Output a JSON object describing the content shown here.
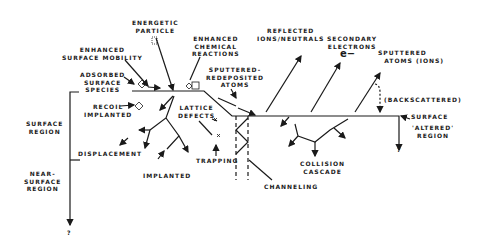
{
  "diagram": {
    "type": "ion-surface interaction schematic",
    "labels": {
      "energetic_particle": "ENERGETIC\nPARTICLE",
      "enhanced_surface_mobility": "ENHANCED\nSURFACE MOBILITY",
      "enhanced_chemical_reactions": "ENHANCED\nCHEMICAL\nREACTIONS",
      "adsorbed_surface_species": "ADSORBED\nSURFACE\nSPECIES",
      "sputtered_redeposited_atoms": "SPUTTERED-\nREDEPOSITED\nATOMS",
      "reflected_ions_neutrals": "REFLECTED\nIONS/NEUTRALS",
      "secondary_electrons": "SECONDARY\nELECTRONS",
      "electron_symbol": "e−",
      "sputtered_atoms_ions": "SPUTTERED\n  ATOMS (IONS)",
      "backscattered": "(BACKSCATTERED)",
      "surface": "SURFACE",
      "altered_region": "'ALTERED'\nREGION",
      "recoil_implanted": "RECOIL\nIMPLANTED",
      "lattice_defects": "LATTICE\nDEFECTS",
      "surface_region": "SURFACE\nREGION",
      "displacement": "DISPLACEMENT",
      "trapping": "TRAPPING",
      "implanted": "IMPLANTED",
      "collision_cascade": "COLLISION\nCASCADE",
      "channeling": "CHANNELING",
      "near_surface_region": "NEAR-\nSURFACE\nREGION",
      "unknown_depth_left": "?",
      "unknown_depth_right": "?"
    },
    "colors": {
      "ink": "#1a1a1a",
      "background": "#ffffff"
    }
  }
}
